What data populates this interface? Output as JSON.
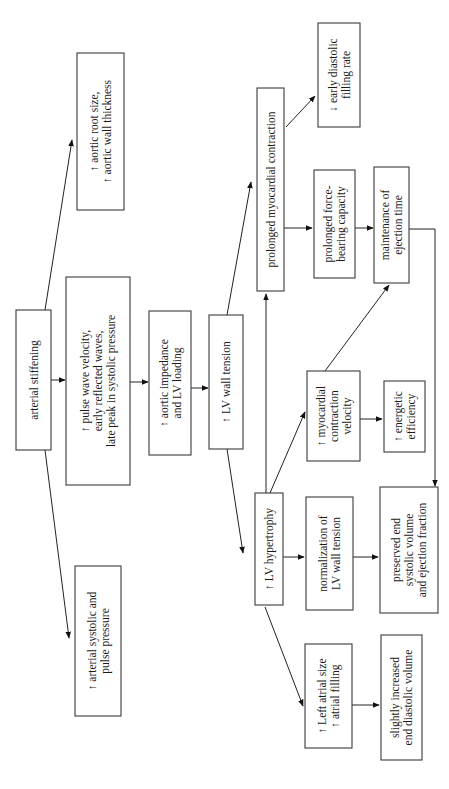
{
  "diagram": {
    "orientation": "rotated-90-ccw",
    "nodes": [
      {
        "id": "arterial_stiffening",
        "lines": [
          "arterial stiffening"
        ]
      },
      {
        "id": "arterial_pressure",
        "lines": [
          "↑ arterial systolic and",
          "pulse pressure"
        ]
      },
      {
        "id": "aortic_root",
        "lines": [
          "↑ aortic root size,",
          "↑ aortic wall thickness"
        ]
      },
      {
        "id": "pulse_wave",
        "lines": [
          "↑ pulse wave velocity,",
          "early reflected waves,",
          "late peak in systolic pressure"
        ]
      },
      {
        "id": "aortic_impedance",
        "lines": [
          "↑ aortic impedance",
          "and LV loading"
        ]
      },
      {
        "id": "lv_wall_tension",
        "lines": [
          "↑ LV wall tension"
        ]
      },
      {
        "id": "prolonged_contraction",
        "lines": [
          "prolonged myocardial contraction"
        ]
      },
      {
        "id": "early_diastolic",
        "lines": [
          "↓ early diastolic",
          "filling rate"
        ]
      },
      {
        "id": "force_bearing",
        "lines": [
          "prolonged force-",
          "bearing capacity"
        ]
      },
      {
        "id": "ejection_time",
        "lines": [
          "maintenance of",
          "ejection time"
        ]
      },
      {
        "id": "lv_hypertrophy",
        "lines": [
          "↑ LV hypertrophy"
        ]
      },
      {
        "id": "contraction_velocity",
        "lines": [
          "↑ myocardial",
          "contraction",
          "velocity"
        ]
      },
      {
        "id": "energetic_efficiency",
        "lines": [
          "↑ energetic",
          "efficiency"
        ]
      },
      {
        "id": "normalization",
        "lines": [
          "normalization of",
          "LV wall tension"
        ]
      },
      {
        "id": "preserved_esv",
        "lines": [
          "preserved end",
          "systolic volume",
          "and ejection fraction"
        ]
      },
      {
        "id": "left_atrial",
        "lines": [
          "↑ Left atrial size",
          "↑ atrial filling"
        ]
      },
      {
        "id": "edv",
        "lines": [
          "slightly increased",
          "end diastolic volume"
        ]
      }
    ],
    "edges": [
      {
        "from": "arterial_stiffening",
        "to": "aortic_root"
      },
      {
        "from": "arterial_stiffening",
        "to": "pulse_wave"
      },
      {
        "from": "arterial_stiffening",
        "to": "arterial_pressure"
      },
      {
        "from": "pulse_wave",
        "to": "aortic_impedance"
      },
      {
        "from": "aortic_impedance",
        "to": "lv_wall_tension"
      },
      {
        "from": "lv_wall_tension",
        "to": "prolonged_contraction"
      },
      {
        "from": "lv_wall_tension",
        "to": "lv_hypertrophy"
      },
      {
        "from": "prolonged_contraction",
        "to": "early_diastolic"
      },
      {
        "from": "prolonged_contraction",
        "to": "force_bearing"
      },
      {
        "from": "force_bearing",
        "to": "ejection_time"
      },
      {
        "from": "ejection_time",
        "to": "preserved_esv"
      },
      {
        "from": "lv_hypertrophy",
        "to": "prolonged_contraction"
      },
      {
        "from": "lv_hypertrophy",
        "to": "contraction_velocity"
      },
      {
        "from": "lv_hypertrophy",
        "to": "normalization"
      },
      {
        "from": "lv_hypertrophy",
        "to": "left_atrial"
      },
      {
        "from": "contraction_velocity",
        "to": "ejection_time"
      },
      {
        "from": "contraction_velocity",
        "to": "energetic_efficiency"
      },
      {
        "from": "normalization",
        "to": "preserved_esv"
      },
      {
        "from": "left_atrial",
        "to": "edv"
      }
    ]
  }
}
